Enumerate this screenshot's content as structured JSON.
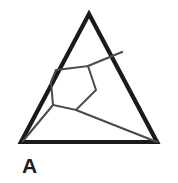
{
  "figure": {
    "label": "A",
    "background_color": "#ffffff",
    "outline_color": "#1a1a1a",
    "inner_line_color": "#4a4a4a",
    "outline_width": 4.2,
    "inner_line_width": 2.0
  },
  "shapes": {
    "outer_triangle": {
      "name": "outer-triangle",
      "points": "89,14 157,142 21,142",
      "stroke": "#1a1a1a",
      "stroke_width": 4.2,
      "fill": "none"
    },
    "hexagon": {
      "name": "inner-hexagon",
      "points": "56,70 88,66 96,90 76,110 53,105 51,82",
      "stroke": "#4a4a4a",
      "stroke_width": 2.0,
      "fill": "none"
    },
    "connector_upper_right": {
      "name": "connector-upper-right",
      "x1": 88,
      "y1": 66,
      "x2": 122,
      "y2": 52,
      "stroke": "#4a4a4a",
      "stroke_width": 2.0
    },
    "connector_lower_right": {
      "name": "connector-lower-right",
      "x1": 76,
      "y1": 110,
      "x2": 157,
      "y2": 142,
      "stroke": "#4a4a4a",
      "stroke_width": 2.0
    },
    "connector_left_base": {
      "name": "connector-left-base",
      "x1": 53,
      "y1": 105,
      "x2": 23,
      "y2": 141,
      "stroke": "#4a4a4a",
      "stroke_width": 2.0
    }
  }
}
